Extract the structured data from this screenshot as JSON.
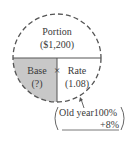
{
  "diagram": {
    "type": "portion-base-rate-circle",
    "top": {
      "title": "Portion",
      "value": "($1,200)"
    },
    "bottom_left": {
      "title": "Base",
      "value": "(?)"
    },
    "operator": "×",
    "bottom_right": {
      "title": "Rate",
      "value": "(1.08)"
    },
    "note": {
      "line1": "Old year100%",
      "line2": "+8%"
    },
    "colors": {
      "stroke": "#555555",
      "shade": "#c8c8c8",
      "text": "#3a3a3a"
    }
  }
}
